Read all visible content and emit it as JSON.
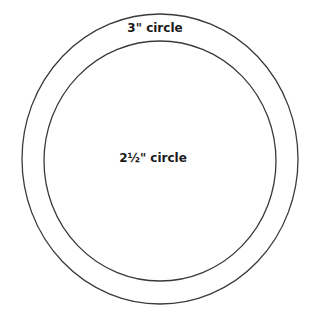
{
  "diagram": {
    "outer_circle": {
      "label": "3\" circle",
      "cx": 160,
      "cy": 159,
      "rx": 138,
      "ry": 145,
      "stroke": "#3a3a3a"
    },
    "inner_circle": {
      "label": "2½\" circle",
      "cx": 160,
      "cy": 161,
      "rx": 116,
      "ry": 120,
      "stroke": "#3a3a3a"
    }
  }
}
